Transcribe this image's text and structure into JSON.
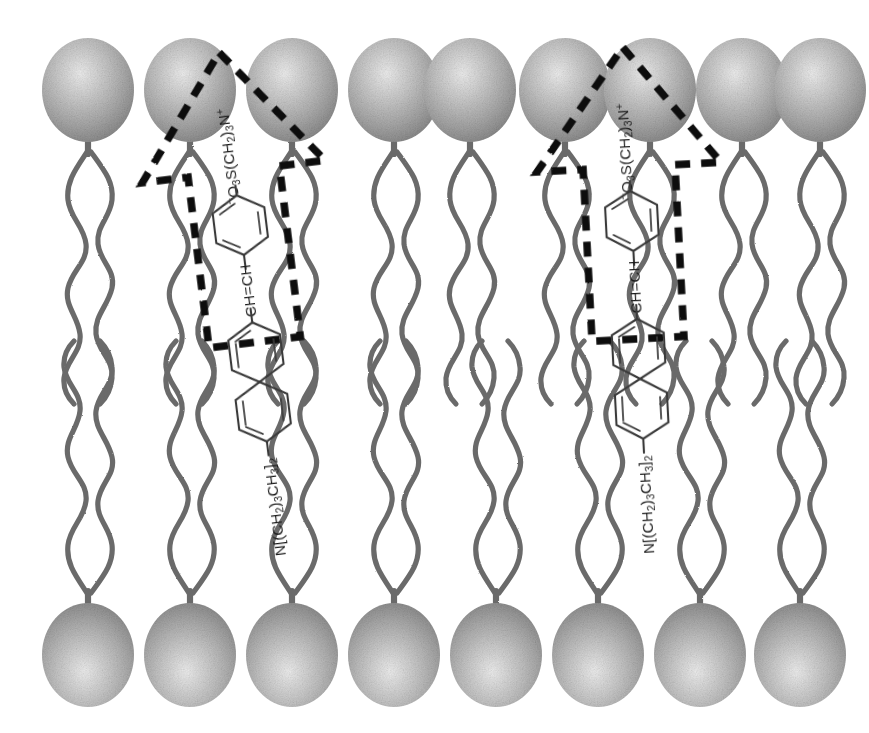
{
  "figure": {
    "background_color": "#ffffff",
    "width": 869,
    "height": 733
  },
  "colors": {
    "headgroup_light": "#e8e8e8",
    "headgroup_mid": "#b6b6b6",
    "headgroup_dark": "#8d8d8d",
    "headgroup_edge": "#7a7a7a",
    "tail_stroke": "#6b6b6b",
    "bond_stroke": "#3a3a3a",
    "arrow_stroke": "#111111",
    "label_text": "#1a1a1a"
  },
  "bilayer": {
    "name": "phospholipid-bilayer",
    "leaflets": [
      {
        "name": "upper-leaflet",
        "headgroup_count": 9,
        "headgroup_row_y": 90,
        "tails_per_headgroup": 2,
        "direction": "down"
      },
      {
        "name": "lower-leaflet",
        "headgroup_count": 8,
        "headgroup_row_y": 655,
        "tails_per_headgroup": 2,
        "direction": "up"
      }
    ],
    "midplane_y": 383,
    "headgroup_shape": "sphere",
    "headgroup_radius_x": 46,
    "headgroup_radius_y": 52
  },
  "upper_headgroup_x": [
    88,
    190,
    292,
    394,
    470,
    565,
    650,
    742,
    820
  ],
  "lower_headgroup_x": [
    88,
    190,
    292,
    394,
    496,
    598,
    700,
    800
  ],
  "probes": [
    {
      "name": "probe-molecule-left",
      "arrow_label": "dashed-arrow-outline-left",
      "tilt_degrees": -7,
      "center_x": 243,
      "fragments": [
        {
          "id": "sulfonate",
          "text": "⁻O₃S(CH₂)₃N⁺",
          "role": "sulfopropyl-pyridinium-headgroup"
        },
        {
          "id": "ring-pyridinium",
          "text": "pyridinium-ring",
          "role": "aromatic-ring"
        },
        {
          "id": "vinyl",
          "text": "CH=CH",
          "role": "vinyl-linker"
        },
        {
          "id": "naphthalene",
          "text": "naphthalene-ring-system",
          "role": "fused-aromatic"
        },
        {
          "id": "amine",
          "text": "N[(CH₂)₃CH₃]₂",
          "role": "dibutylamino-tail"
        }
      ]
    },
    {
      "name": "probe-molecule-right",
      "arrow_label": "dashed-arrow-outline-right",
      "tilt_degrees": -3,
      "center_x": 630,
      "fragments": [
        {
          "id": "sulfonate",
          "text": "⁻O₃S(CH₂)₃N⁺",
          "role": "sulfopropyl-pyridinium-headgroup"
        },
        {
          "id": "ring-pyridinium",
          "text": "pyridinium-ring",
          "role": "aromatic-ring"
        },
        {
          "id": "vinyl",
          "text": "CH=CH",
          "role": "vinyl-linker"
        },
        {
          "id": "naphthalene",
          "text": "naphthalene-ring-system",
          "role": "fused-aromatic"
        },
        {
          "id": "amine",
          "text": "N[(CH₂)₃CH₃]₂",
          "role": "dibutylamino-tail"
        }
      ]
    }
  ],
  "labels": {
    "sulfonate_main": "O",
    "sulfonate_sub_3": "3",
    "sulfonate_s": "S(CH",
    "sulfonate_sub_2": "2",
    "sulfonate_close": ")",
    "sulfonate_sub_3b": "3",
    "sulfonate_n": "N",
    "minus_sign": "−",
    "plus_sign": "+",
    "vinyl_left": "CH",
    "vinyl_eq": "=",
    "vinyl_right": "CH",
    "amine_n": "N[(CH",
    "amine_sub2": "2",
    "amine_close1": ")",
    "amine_sub3": "3",
    "amine_ch": "CH",
    "amine_sub3b": "3",
    "amine_close2": "]",
    "amine_sub2b": "2"
  }
}
